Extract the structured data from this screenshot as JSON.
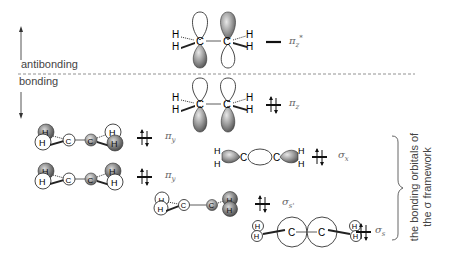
{
  "energy_axis": {
    "antibonding_label": "antibonding",
    "bonding_label": "bonding"
  },
  "orbitals": [
    {
      "id": "pi_z_star",
      "symbol": "π",
      "subscript": "z",
      "superscript": "*",
      "occupancy": "empty",
      "region": "antibonding"
    },
    {
      "id": "pi_z",
      "symbol": "π",
      "subscript": "z",
      "superscript": "",
      "occupancy": "paired",
      "region": "bonding"
    },
    {
      "id": "pi_y_a",
      "symbol": "π",
      "subscript": "y",
      "superscript": "",
      "occupancy": "paired",
      "region": "bonding"
    },
    {
      "id": "pi_y_b",
      "symbol": "π",
      "subscript": "y",
      "superscript": "",
      "occupancy": "paired",
      "region": "bonding"
    },
    {
      "id": "sigma_x",
      "symbol": "σ",
      "subscript": "x",
      "superscript": "",
      "occupancy": "paired",
      "region": "bonding"
    },
    {
      "id": "sigma_s_prime",
      "symbol": "σ",
      "subscript": "s'",
      "superscript": "",
      "occupancy": "paired",
      "region": "bonding"
    },
    {
      "id": "sigma_s",
      "symbol": "σ",
      "subscript": "s",
      "superscript": "",
      "occupancy": "paired",
      "region": "bonding"
    }
  ],
  "atoms": {
    "carbon": "C",
    "hydrogen": "H"
  },
  "brace_annotation": {
    "line1": "the bonding orbitals of",
    "line2": "the σ framework"
  },
  "colors": {
    "lobe_shaded": "#8a8a8a",
    "lobe_open": "#ffffff",
    "outline": "#333333",
    "dashed_divider": "#777777"
  }
}
